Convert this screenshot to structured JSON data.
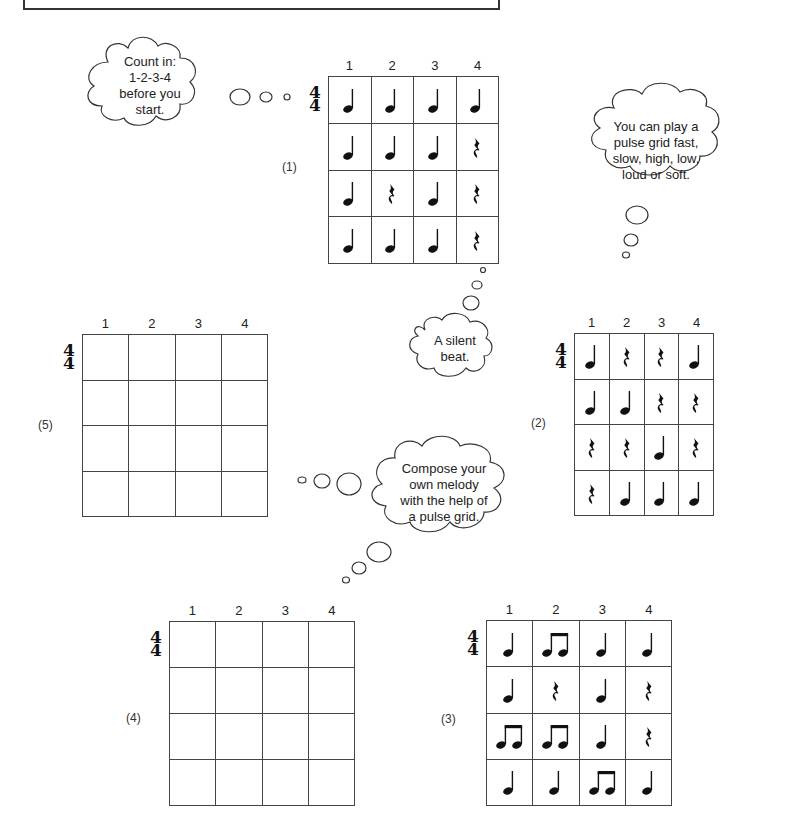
{
  "clouds": [
    {
      "id": "count-in",
      "text": [
        "Count in:",
        "1-2-3-4",
        "before you",
        "start."
      ]
    },
    {
      "id": "pulse-grid-tip",
      "text": [
        "You can play a",
        "pulse grid fast,",
        "slow, high, low,",
        "loud or soft."
      ]
    },
    {
      "id": "silent-beat",
      "text": [
        "A silent",
        "beat."
      ]
    },
    {
      "id": "compose",
      "text": [
        "Compose your",
        "own melody",
        "with the help of",
        "a pulse grid."
      ]
    }
  ],
  "time_signature": {
    "top": "4",
    "bottom": "4"
  },
  "column_numbers": [
    "1",
    "2",
    "3",
    "4"
  ],
  "grids": {
    "g1": {
      "label": "(1)",
      "rows": [
        [
          "q",
          "q",
          "q",
          "q"
        ],
        [
          "q",
          "q",
          "q",
          "r"
        ],
        [
          "q",
          "r",
          "q",
          "r"
        ],
        [
          "q",
          "q",
          "q",
          "r"
        ]
      ]
    },
    "g2": {
      "label": "(2)",
      "rows": [
        [
          "q",
          "r",
          "r",
          "q"
        ],
        [
          "q",
          "q",
          "r",
          "r"
        ],
        [
          "r",
          "r",
          "q",
          "r"
        ],
        [
          "r",
          "q",
          "q",
          "q"
        ]
      ]
    },
    "g3": {
      "label": "(3)",
      "rows": [
        [
          "q",
          "e",
          "q",
          "q"
        ],
        [
          "q",
          "r",
          "q",
          "r"
        ],
        [
          "e",
          "e",
          "q",
          "r"
        ],
        [
          "q",
          "q",
          "e",
          "q"
        ]
      ]
    },
    "g4": {
      "label": "(4)",
      "rows": [
        [
          "",
          "",
          "",
          ""
        ],
        [
          "",
          "",
          "",
          ""
        ],
        [
          "",
          "",
          "",
          ""
        ],
        [
          "",
          "",
          "",
          ""
        ]
      ]
    },
    "g5": {
      "label": "(5)",
      "rows": [
        [
          "",
          "",
          "",
          ""
        ],
        [
          "",
          "",
          "",
          ""
        ],
        [
          "",
          "",
          "",
          ""
        ],
        [
          "",
          "",
          "",
          ""
        ]
      ]
    }
  },
  "legend": {
    "q": "quarter-note",
    "e": "two-eighth-notes",
    "r": "quarter-rest",
    "": "empty"
  }
}
